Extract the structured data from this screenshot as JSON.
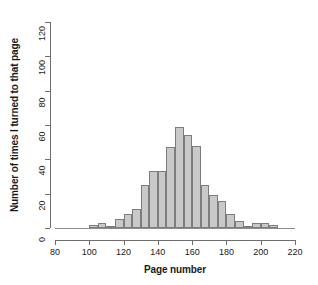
{
  "chart_data": {
    "type": "bar",
    "title": "",
    "xlabel": "Page number",
    "ylabel": "Number of times I turned to that page",
    "xlim": [
      80,
      220
    ],
    "ylim": [
      0,
      120
    ],
    "xticks": [
      80,
      100,
      120,
      140,
      160,
      180,
      200,
      220
    ],
    "yticks": [
      0,
      20,
      40,
      60,
      80,
      100,
      120
    ],
    "grid": false,
    "legend": null,
    "bin_width": 5,
    "bin_starts": [
      100,
      105,
      110,
      115,
      120,
      125,
      130,
      135,
      140,
      145,
      150,
      155,
      160,
      165,
      170,
      175,
      180,
      185,
      190,
      195,
      200,
      205
    ],
    "categories": [
      "100-105",
      "105-110",
      "110-115",
      "115-120",
      "120-125",
      "125-130",
      "130-135",
      "135-140",
      "140-145",
      "145-150",
      "150-155",
      "155-160",
      "160-165",
      "165-170",
      "170-175",
      "175-180",
      "180-185",
      "185-190",
      "190-195",
      "195-200",
      "200-205",
      "205-210"
    ],
    "values": [
      2,
      3,
      1,
      5,
      8,
      11,
      25,
      33,
      33,
      47,
      59,
      54,
      48,
      25,
      19,
      16,
      8,
      4,
      1,
      3,
      3,
      2
    ],
    "bar_fill_color": "#c9c9c9",
    "bar_edge_color": "#7d7d7d",
    "axis_color": "#6e6e6e",
    "background_color": "#ffffff"
  },
  "axes": {
    "x_title": "Page number",
    "y_title": "Number of times I turned to that page",
    "x_tick_labels": [
      "80",
      "100",
      "120",
      "140",
      "160",
      "180",
      "200",
      "220"
    ],
    "y_tick_labels": [
      "0",
      "20",
      "40",
      "60",
      "80",
      "100",
      "120"
    ]
  }
}
